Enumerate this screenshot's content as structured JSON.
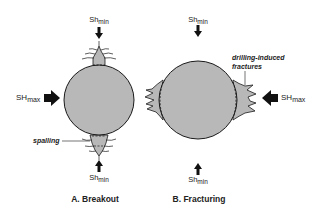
{
  "colors": {
    "rock_fill": "#b8b8b8",
    "outline": "#1a1a1a",
    "text": "#222222",
    "background": "#ffffff"
  },
  "stress": {
    "sh_min_base": "Sh",
    "sh_min_sub": "min",
    "sh_max_base": "SH",
    "sh_max_sub": "max"
  },
  "panel_a": {
    "caption": "A. Breakout",
    "annotation": "spalling"
  },
  "panel_b": {
    "caption": "B. Fracturing",
    "annotation_line1": "drilling-induced",
    "annotation_line2": "fractures"
  }
}
